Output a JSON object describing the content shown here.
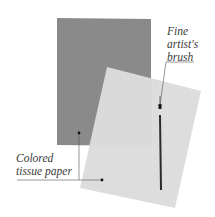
{
  "illustration": {
    "subject": "Materials for tissue paper craft",
    "items": [
      {
        "id": "dark-tissue-sheet",
        "description": "Dark gray colored tissue paper sheet",
        "color": "#8a8a8a"
      },
      {
        "id": "light-tissue-sheet",
        "description": "Light gray colored tissue paper sheet, rotated and overlapping",
        "color": "#dcdcdc"
      },
      {
        "id": "artist-brush",
        "description": "Fine artist's brush lying on light sheet",
        "color": "#2a2a2a"
      }
    ]
  },
  "labels": {
    "brush": {
      "lines": [
        "Fine",
        "artist's",
        "brush"
      ]
    },
    "tissue": {
      "lines": [
        "Colored",
        "tissue paper"
      ]
    }
  },
  "colors": {
    "background": "#ffffff",
    "dark_paper": "#8c8c8c",
    "light_paper": "#dedede",
    "brush": "#2b2b2b",
    "leader_line": "#555555",
    "label_text": "#3a3a3a"
  }
}
